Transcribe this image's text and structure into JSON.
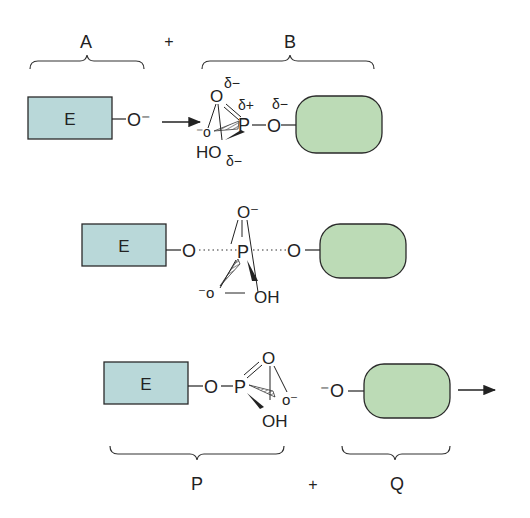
{
  "figure": {
    "colors": {
      "enzyme_box": "#b9d8d9",
      "substrate_box": "#bcdbb6",
      "stroke": "#2a2a2a",
      "background": "#ffffff"
    }
  },
  "labels": {
    "reactant_a": "A",
    "reactant_b": "B",
    "plus_top": "+",
    "product_p": "P",
    "product_q": "Q",
    "plus_bottom": "+"
  },
  "step1": {
    "enzyme_label": "E",
    "nucleophile": "O⁻",
    "phosphate": {
      "apical_o": "O",
      "delta_minus_top": "δ−",
      "delta_plus": "δ+",
      "p_atom": "P",
      "o_minus": "⁻o",
      "ho": "HO",
      "delta_minus_bottom": "δ−",
      "bridge_o": "O",
      "delta_minus_bridge": "δ−"
    }
  },
  "step2": {
    "enzyme_label": "E",
    "left_o": "O",
    "p_atom": "P",
    "top_o": "O⁻",
    "o_minus": "⁻o",
    "oh": "OH",
    "right_o": "O"
  },
  "step3": {
    "enzyme_label": "E",
    "ester_o": "O",
    "p_atom": "P",
    "top_o": "O",
    "o_minus": "o⁻",
    "oh": "OH",
    "leaving_o": "⁻O"
  }
}
